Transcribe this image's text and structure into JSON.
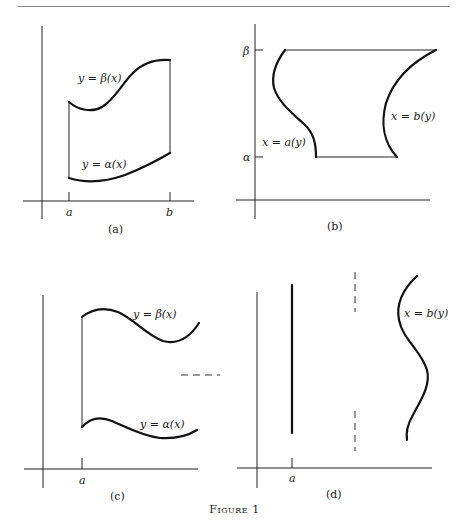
{
  "page": {
    "figure_caption": "Figure 1"
  },
  "panels": {
    "a": {
      "caption": "(a)",
      "upper_curve_label": "y = β(x)",
      "lower_curve_label": "y = α(x)",
      "x_tick_left": "a",
      "x_tick_right": "b"
    },
    "b": {
      "caption": "(b)",
      "left_curve_label": "x = a(y)",
      "right_curve_label": "x = b(y)",
      "y_tick_top": "β",
      "y_tick_bottom": "α"
    },
    "c": {
      "caption": "(c)",
      "upper_curve_label": "y = β(x)",
      "lower_curve_label": "y = α(x)",
      "x_tick_left": "a"
    },
    "d": {
      "caption": "(d)",
      "right_curve_label": "x = b(y)",
      "x_tick_left": "a"
    }
  },
  "colors": {
    "ink": "#1a1a1a",
    "rule": "#8a8a8a",
    "background": "#ffffff"
  }
}
